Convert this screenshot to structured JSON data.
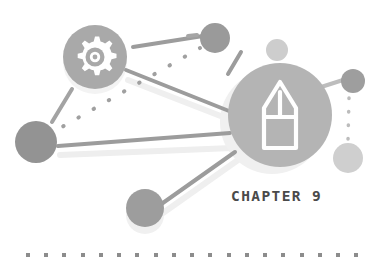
{
  "illustration": {
    "title_label": "CHAPTER 9",
    "background_color": "#ffffff",
    "palette": {
      "dark_gray": "#8f8f8f",
      "mid_gray": "#a8a8a8",
      "light_gray": "#bdbdbd",
      "pale_gray": "#d2d2d2",
      "shadow_gray": "#ededed",
      "line_gray": "#9a9a9a",
      "text_gray": "#4a4a4a",
      "dot_gray": "#8a8a8a"
    },
    "icons": [
      {
        "name": "gear-icon",
        "label": "gear",
        "cx": 95,
        "cy": 57,
        "r": 32,
        "circle_color": "#a9a9a9",
        "glyph_color": "#ffffff"
      },
      {
        "name": "pencil-icon",
        "label": "pencil",
        "cx": 280,
        "cy": 115,
        "r": 52,
        "circle_color": "#b4b4b4",
        "glyph_color": "#ffffff"
      }
    ],
    "nodes": [
      {
        "name": "node-top-mid",
        "cx": 215,
        "cy": 38,
        "r": 15,
        "color": "#9a9a9a"
      },
      {
        "name": "node-top-right",
        "cx": 277,
        "cy": 50,
        "r": 11,
        "color": "#cdcdcd"
      },
      {
        "name": "node-left",
        "cx": 36,
        "cy": 142,
        "r": 21,
        "color": "#939393"
      },
      {
        "name": "node-right-upper",
        "cx": 353,
        "cy": 81,
        "r": 12,
        "color": "#9e9e9e"
      },
      {
        "name": "node-right-lower",
        "cx": 348,
        "cy": 158,
        "r": 15,
        "color": "#cfcfcf"
      },
      {
        "name": "node-bottom",
        "cx": 145,
        "cy": 208,
        "r": 19,
        "color": "#9d9d9d"
      }
    ],
    "connections": [
      {
        "name": "link-gear-to-top-mid",
        "style": "solid"
      },
      {
        "name": "link-gear-to-pencil",
        "style": "solid"
      },
      {
        "name": "link-left-to-pencil",
        "style": "solid"
      },
      {
        "name": "link-left-to-top-mid-dotted",
        "style": "dotted"
      },
      {
        "name": "link-pencil-to-bottom",
        "style": "solid"
      },
      {
        "name": "link-pencil-to-right-upper",
        "style": "solid"
      },
      {
        "name": "link-right-upper-to-right-lower",
        "style": "dotted"
      },
      {
        "name": "link-short-upper-left",
        "style": "solid"
      },
      {
        "name": "link-short-above-pencil",
        "style": "solid"
      }
    ],
    "bottom_dots": {
      "name": "bottom-dot-row",
      "count": 19,
      "start_x": 26,
      "spacing": 18.2,
      "y": 255,
      "size": 4,
      "color": "#8c8c8c"
    }
  }
}
